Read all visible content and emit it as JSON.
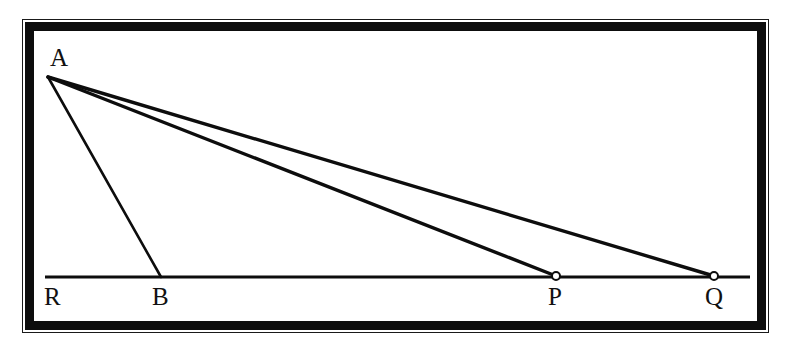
{
  "figure": {
    "background_color": "#ffffff",
    "ink_color": "#0d0d0d",
    "frame": {
      "outer_line_color": "#1a1a1a",
      "border_color": "#0d0d0d",
      "border_width_px": 9
    },
    "baseline": {
      "name": "horizontal-ray",
      "start_x": 45,
      "end_x": 750,
      "y": 277,
      "stroke_width": 3.2
    },
    "points": [
      {
        "id": "A",
        "label": "A",
        "x": 48,
        "y": 77,
        "marker": "none",
        "label_x": 50,
        "label_y": 45
      },
      {
        "id": "R",
        "label": "R",
        "x": 52,
        "y": 277,
        "marker": "none",
        "label_x": 44,
        "label_y": 284
      },
      {
        "id": "B",
        "label": "B",
        "x": 160,
        "y": 277,
        "marker": "none",
        "label_x": 152,
        "label_y": 284
      },
      {
        "id": "P",
        "label": "P",
        "x": 556,
        "y": 276,
        "marker": "open-circle",
        "label_x": 548,
        "label_y": 284
      },
      {
        "id": "Q",
        "label": "Q",
        "x": 714,
        "y": 276,
        "marker": "open-circle",
        "label_x": 705,
        "label_y": 284
      }
    ],
    "segments": [
      {
        "name": "segment-AB",
        "from": "A",
        "to": "B",
        "x1": 48,
        "y1": 77,
        "x2": 161,
        "y2": 277,
        "stroke_width": 2.6
      },
      {
        "name": "segment-AP",
        "from": "A",
        "to": "P",
        "x1": 48,
        "y1": 77,
        "x2": 556,
        "y2": 276,
        "stroke_width": 3.4
      },
      {
        "name": "segment-AQ",
        "from": "A",
        "to": "Q",
        "x1": 48,
        "y1": 77,
        "x2": 714,
        "y2": 276,
        "stroke_width": 3.4
      }
    ],
    "markers": {
      "radius": 4,
      "fill": "#ffffff",
      "stroke": "#0d0d0d",
      "stroke_width": 2
    }
  }
}
